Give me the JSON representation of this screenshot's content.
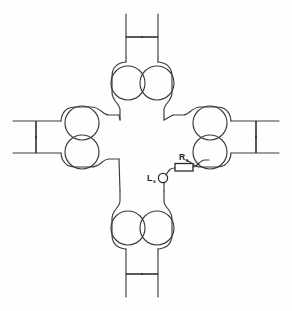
{
  "figure": {
    "background_color": "#fefefe",
    "line_color": "#3a3a3a",
    "label_color": "#1a1a1a"
  },
  "labels": {
    "resistor": {
      "symbol": "R",
      "subscript": "s",
      "full": "Rs"
    },
    "inductor": {
      "symbol": "L",
      "subscript": "s",
      "full": "Ls"
    }
  },
  "components": {
    "arms": [
      {
        "name": "top-arm",
        "orientation": "up",
        "loop_count": 2,
        "capacitor_count": 2
      },
      {
        "name": "right-arm",
        "orientation": "right",
        "loop_count": 2,
        "capacitor_count": 2
      },
      {
        "name": "bottom-arm",
        "orientation": "down",
        "loop_count": 2,
        "capacitor_count": 2
      },
      {
        "name": "left-arm",
        "orientation": "left",
        "loop_count": 2,
        "capacitor_count": 2
      }
    ],
    "lumped_elements": [
      {
        "name": "series-resistor",
        "label": "Rs",
        "type": "resistor"
      },
      {
        "name": "series-inductor",
        "label": "Ls",
        "type": "inductor"
      }
    ]
  }
}
